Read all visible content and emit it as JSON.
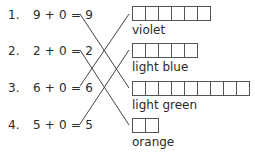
{
  "equations": [
    {
      "num": "1.",
      "expr": "9 + 0 = 9"
    },
    {
      "num": "2.",
      "expr": "2 + 0 = 2"
    },
    {
      "num": "3.",
      "expr": "6 + 0 = 6"
    },
    {
      "num": "4.",
      "expr": "5 + 0 = 5"
    }
  ],
  "colors": [
    {
      "label": "violet",
      "boxes": 6
    },
    {
      "label": "light blue",
      "boxes": 5
    },
    {
      "label": "light green",
      "boxes": 9
    },
    {
      "label": "orange",
      "boxes": 2
    }
  ],
  "connections": [
    {
      "from": "9 + 0 = 9",
      "to": "light green"
    },
    {
      "from": "2 + 0 = 2",
      "to": "orange"
    },
    {
      "from": "6 + 0 = 6",
      "to": "violet"
    },
    {
      "from": "5 + 0 = 5",
      "to": "light blue"
    }
  ]
}
